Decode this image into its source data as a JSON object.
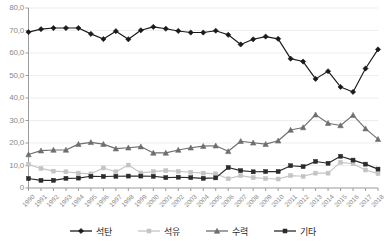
{
  "chart_data": {
    "type": "line",
    "title": "",
    "subtitle": "",
    "xlabel": "",
    "ylabel": "",
    "ylim": [
      0,
      80
    ],
    "ytick_labels": [
      "80,0",
      "70,0",
      "60,0",
      "50,0",
      "40,0",
      "30,0",
      "20,0",
      "10,0",
      "0"
    ],
    "ytick_values": [
      80,
      70,
      60,
      50,
      40,
      30,
      20,
      10,
      0
    ],
    "grid": "horizontal",
    "legend_position": "bottom",
    "categories": [
      "1990",
      "1991",
      "1992",
      "1993",
      "1994",
      "1995",
      "1996",
      "1997",
      "1998",
      "1999",
      "2000",
      "2001",
      "2002",
      "2003",
      "2004",
      "2005",
      "2006",
      "2007",
      "2008",
      "2009",
      "2010",
      "2011",
      "2012",
      "2013",
      "2014",
      "2015",
      "2016",
      "2017",
      "2018"
    ],
    "series": [
      {
        "name": "석탄",
        "color": "#1a1a1a",
        "marker": "diamond",
        "values": [
          69.3,
          70.6,
          71.1,
          71.1,
          71.1,
          68.5,
          66.2,
          69.7,
          66.1,
          70.1,
          71.6,
          70.8,
          69.8,
          69.1,
          69.1,
          69.9,
          68.1,
          63.8,
          66.1,
          67.3,
          66.3,
          57.5,
          56.2,
          48.5,
          51.9,
          44.9,
          42.7,
          53.1,
          61.6
        ]
      },
      {
        "name": "석유",
        "color": "#c4c4c4",
        "marker": "square",
        "values": [
          10.5,
          8.7,
          7.5,
          7.2,
          6.6,
          6.3,
          8.9,
          7.2,
          10.2,
          6.7,
          7.3,
          7.7,
          7.4,
          7.0,
          6.6,
          6.3,
          4.1,
          5.5,
          4.6,
          4.2,
          4.0,
          5.5,
          5.2,
          6.6,
          6.6,
          11.4,
          10.8,
          8.0,
          6.4
        ]
      },
      {
        "name": "수력",
        "color": "#6e6e6e",
        "marker": "triangle",
        "values": [
          14.9,
          16.6,
          16.9,
          16.9,
          19.5,
          20.3,
          19.5,
          17.5,
          17.9,
          18.4,
          15.6,
          15.6,
          16.9,
          17.9,
          18.6,
          18.8,
          16.3,
          20.8,
          20.1,
          19.5,
          21.0,
          25.8,
          26.9,
          32.6,
          28.8,
          27.8,
          32.4,
          26.4,
          21.7
        ]
      },
      {
        "name": "기타",
        "color": "#2b2b2b",
        "marker": "square",
        "values": [
          4.2,
          3.4,
          3.4,
          4.3,
          4.4,
          5.2,
          5.1,
          5.2,
          5.3,
          5.3,
          5.2,
          4.6,
          4.8,
          4.6,
          4.3,
          4.5,
          9.1,
          7.7,
          7.2,
          7.3,
          7.3,
          9.9,
          9.5,
          11.8,
          11.0,
          14.1,
          12.4,
          10.6,
          8.4
        ]
      }
    ]
  }
}
